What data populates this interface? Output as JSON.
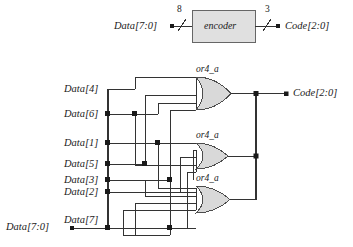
{
  "figure": {
    "background": "#ffffff",
    "wire_color": "#333333",
    "gate_fill": "#d9d9d9",
    "gate_stroke": "#4d4d4d",
    "box_fill": "#e0e0e0",
    "box_stroke": "#666666"
  },
  "top_diagram": {
    "input_label": "Data[7:0]",
    "input_bus_width": "8",
    "block_label": "encoder",
    "output_bus_width": "3",
    "output_label": "Code[2:0]"
  },
  "bottom_diagram": {
    "bus_label": "Data[7:0]",
    "output_label": "Code[2:0]",
    "input_labels": [
      {
        "name": "Data[4]",
        "y": 92
      },
      {
        "name": "Data[6]",
        "y": 115
      },
      {
        "name": "Data[1]",
        "y": 145
      },
      {
        "name": "Data[5]",
        "y": 166
      },
      {
        "name": "Data[3]",
        "y": 182
      },
      {
        "name": "Data[2]",
        "y": 194
      },
      {
        "name": "Data[7]",
        "y": 221
      }
    ],
    "gates": [
      {
        "name": "or4_a",
        "inputs": [
          "Data[4]",
          "Data[5]",
          "Data[6]",
          "Data[7]"
        ],
        "output": "Code[2]"
      },
      {
        "name": "or4_a",
        "inputs": [
          "Data[2]",
          "Data[3]",
          "Data[6]",
          "Data[7]"
        ],
        "output": "Code[1]"
      },
      {
        "name": "or4_a",
        "inputs": [
          "Data[1]",
          "Data[3]",
          "Data[5]",
          "Data[7]"
        ],
        "output": "Code[0]"
      }
    ]
  }
}
